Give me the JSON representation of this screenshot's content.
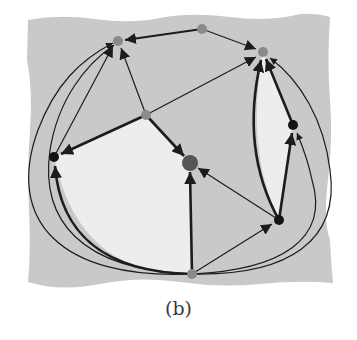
{
  "caption": "(b)",
  "colors": {
    "background_region": "#c9c9c9",
    "light_face": "#ececec",
    "edge": "#1c1c1c",
    "node_gray": "#8a8a8a",
    "node_black": "#141414",
    "node_dark": "#555555"
  },
  "nodes": [
    {
      "id": "A",
      "x": 118,
      "y": 41,
      "r": 5,
      "fill": "gray"
    },
    {
      "id": "B",
      "x": 202,
      "y": 29,
      "r": 5,
      "fill": "gray"
    },
    {
      "id": "C",
      "x": 263,
      "y": 52,
      "r": 5,
      "fill": "gray"
    },
    {
      "id": "D",
      "x": 146,
      "y": 115,
      "r": 5,
      "fill": "gray"
    },
    {
      "id": "E",
      "x": 54,
      "y": 157,
      "r": 5,
      "fill": "black"
    },
    {
      "id": "F",
      "x": 190,
      "y": 163,
      "r": 8,
      "fill": "dark"
    },
    {
      "id": "G",
      "x": 293,
      "y": 125,
      "r": 5,
      "fill": "black"
    },
    {
      "id": "H",
      "x": 279,
      "y": 220,
      "r": 5,
      "fill": "black"
    },
    {
      "id": "I",
      "x": 192,
      "y": 274,
      "r": 5,
      "fill": "gray"
    }
  ],
  "edges": [
    {
      "from": "B",
      "to": "A",
      "weight": "medium"
    },
    {
      "from": "B",
      "to": "C",
      "weight": "thin"
    },
    {
      "from": "D",
      "to": "A",
      "weight": "thin"
    },
    {
      "from": "D",
      "to": "C",
      "weight": "thin"
    },
    {
      "from": "D",
      "to": "E",
      "weight": "thick"
    },
    {
      "from": "D",
      "to": "F",
      "weight": "thick"
    },
    {
      "from": "E",
      "to": "A",
      "weight": "thin"
    },
    {
      "from": "I",
      "to": "F",
      "weight": "thick"
    },
    {
      "from": "H",
      "to": "F",
      "weight": "thin"
    },
    {
      "from": "I",
      "to": "H",
      "weight": "thin"
    },
    {
      "from": "H",
      "to": "G",
      "weight": "thick"
    },
    {
      "from": "G",
      "to": "C",
      "weight": "thick"
    },
    {
      "from": "H",
      "to": "C",
      "weight": "thick",
      "curved": true
    },
    {
      "from": "I",
      "to": "E",
      "weight": "thick",
      "curved": true
    },
    {
      "from": "I",
      "to": "A",
      "weight": "thin",
      "curved": true
    },
    {
      "from": "I",
      "to": "A",
      "weight": "thin",
      "curved": true
    },
    {
      "from": "I",
      "to": "G",
      "weight": "thin",
      "curved": true
    },
    {
      "from": "I",
      "to": "C",
      "weight": "thin",
      "curved": true
    }
  ]
}
